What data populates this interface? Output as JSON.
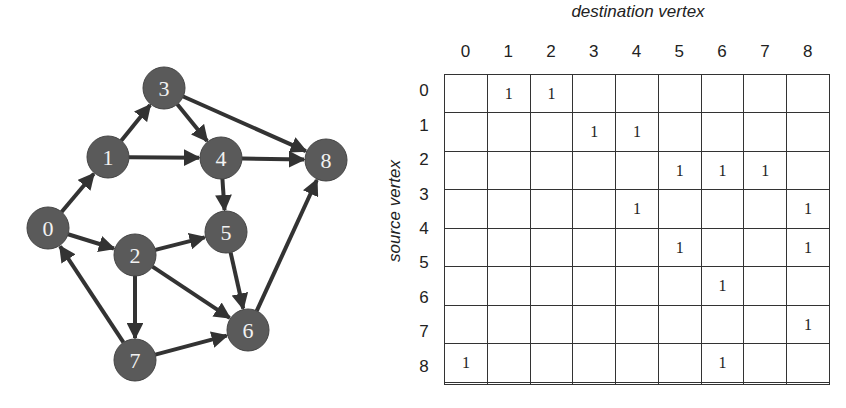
{
  "graph": {
    "node_color": "#5a5a5a",
    "edge_color": "#333333",
    "nodes": [
      {
        "id": "0",
        "x": 48,
        "y": 228
      },
      {
        "id": "1",
        "x": 108,
        "y": 157
      },
      {
        "id": "2",
        "x": 135,
        "y": 255
      },
      {
        "id": "3",
        "x": 164,
        "y": 88
      },
      {
        "id": "4",
        "x": 221,
        "y": 158
      },
      {
        "id": "5",
        "x": 226,
        "y": 232
      },
      {
        "id": "6",
        "x": 248,
        "y": 330
      },
      {
        "id": "7",
        "x": 135,
        "y": 360
      },
      {
        "id": "8",
        "x": 326,
        "y": 160
      }
    ],
    "edges": [
      [
        "0",
        "1"
      ],
      [
        "0",
        "2"
      ],
      [
        "1",
        "3"
      ],
      [
        "1",
        "4"
      ],
      [
        "2",
        "5"
      ],
      [
        "2",
        "6"
      ],
      [
        "2",
        "7"
      ],
      [
        "3",
        "4"
      ],
      [
        "3",
        "8"
      ],
      [
        "4",
        "5"
      ],
      [
        "4",
        "8"
      ],
      [
        "5",
        "6"
      ],
      [
        "6",
        "8"
      ],
      [
        "7",
        "0"
      ],
      [
        "7",
        "6"
      ]
    ]
  },
  "matrix": {
    "title_top": "destination vertex",
    "title_side": "source vertex",
    "col_labels": [
      "0",
      "1",
      "2",
      "3",
      "4",
      "5",
      "6",
      "7",
      "8"
    ],
    "row_labels": [
      "0",
      "1",
      "2",
      "3",
      "4",
      "5",
      "6",
      "7",
      "8"
    ],
    "rows": [
      [
        "",
        "1",
        "1",
        "",
        "",
        "",
        "",
        "",
        ""
      ],
      [
        "",
        "",
        "",
        "1",
        "1",
        "",
        "",
        "",
        ""
      ],
      [
        "",
        "",
        "",
        "",
        "",
        "1",
        "1",
        "1",
        ""
      ],
      [
        "",
        "",
        "",
        "",
        "1",
        "",
        "",
        "",
        "1"
      ],
      [
        "",
        "",
        "",
        "",
        "",
        "1",
        "",
        "",
        "1"
      ],
      [
        "",
        "",
        "",
        "",
        "",
        "",
        "1",
        "",
        ""
      ],
      [
        "",
        "",
        "",
        "",
        "",
        "",
        "",
        "",
        "1"
      ],
      [
        "1",
        "",
        "",
        "",
        "",
        "",
        "1",
        "",
        ""
      ],
      [
        "",
        "",
        "",
        "",
        "",
        "",
        "",
        "",
        ""
      ]
    ]
  }
}
